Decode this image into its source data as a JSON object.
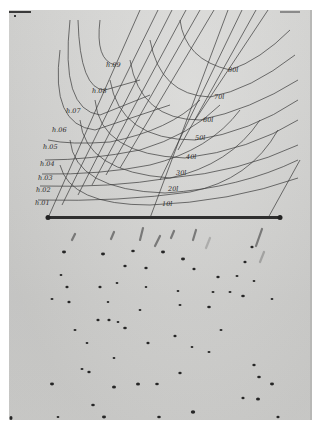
{
  "image": {
    "description": "Photograph of an X-ray diffraction plate with a superimposed Bernal-type chart of h and l coordinate curves",
    "background_color": "#ffffff",
    "plate_color": "#d4d4d2",
    "ink_color": "#2a2a2a"
  },
  "chart_overlay": {
    "h_curve_labels": [
      "h.01",
      "h.02",
      "h.03",
      "h.04",
      "h.05",
      "h.06",
      "h.07",
      "h.08",
      "h.09"
    ],
    "l_curve_labels": [
      "10l",
      "20l",
      "30l",
      "40l",
      "50l",
      "60l",
      "70l",
      "80l"
    ]
  },
  "labels": {
    "h01": "h.01",
    "h02": "h.02",
    "h03": "h.03",
    "h04": "h.04",
    "h05": "h.05",
    "h06": "h.06",
    "h07": "h.07",
    "h08": "h.08",
    "h09": "h.09",
    "l10": "10l",
    "l20": "20l",
    "l30": "30l",
    "l40": "40l",
    "l50": "50l",
    "l60": "60l",
    "l70": "70l",
    "l80": "80l"
  }
}
